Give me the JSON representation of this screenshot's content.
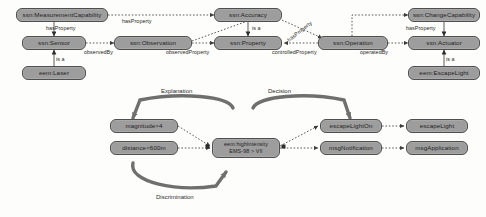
{
  "diagram": {
    "colors": {
      "node_fill": "#9d9d9d",
      "node_border": "#4f4f4f",
      "edge": "#555555",
      "arc": "#6f6f6f",
      "background": "#fdfdfb"
    },
    "upper_nodes": [
      {
        "id": "measurement_capability",
        "label": "ssn:MeasurementCapability",
        "x": 16,
        "y": 8,
        "w": 92,
        "h": 14
      },
      {
        "id": "sensor",
        "label": "ssn:Sensor",
        "x": 22,
        "y": 36,
        "w": 64,
        "h": 14
      },
      {
        "id": "laser",
        "label": "eem:Laser",
        "x": 22,
        "y": 66,
        "w": 64,
        "h": 14
      },
      {
        "id": "observation",
        "label": "ssn:Observation",
        "x": 114,
        "y": 36,
        "w": 78,
        "h": 14
      },
      {
        "id": "accuracy",
        "label": "ssn:Accuracy",
        "x": 214,
        "y": 8,
        "w": 68,
        "h": 14
      },
      {
        "id": "property",
        "label": "ssn:Property",
        "x": 214,
        "y": 36,
        "w": 68,
        "h": 14
      },
      {
        "id": "operation",
        "label": "ssn:Operation",
        "x": 318,
        "y": 36,
        "w": 70,
        "h": 14
      },
      {
        "id": "change_capability",
        "label": "ssn:ChangeCapability",
        "x": 408,
        "y": 8,
        "w": 72,
        "h": 14
      },
      {
        "id": "actuator",
        "label": "ssn:Actuator",
        "x": 408,
        "y": 36,
        "w": 72,
        "h": 14
      },
      {
        "id": "escape_light_class",
        "label": "eem:EscapeLight",
        "x": 408,
        "y": 66,
        "w": 72,
        "h": 14
      }
    ],
    "upper_edge_labels": [
      {
        "id": "has_property_sensor",
        "label": "hasProperty",
        "x": 46,
        "y": 25
      },
      {
        "id": "is_a_laser",
        "label": "is a",
        "x": 52,
        "y": 56
      },
      {
        "id": "observed_by",
        "label": "observedBy",
        "x": 88,
        "y": 50
      },
      {
        "id": "has_property_top",
        "label": "hasProperty",
        "x": 122,
        "y": 20
      },
      {
        "id": "observed_property",
        "label": "observedProperty",
        "x": 172,
        "y": 50
      },
      {
        "id": "is_a_accuracy",
        "label": "is a",
        "x": 252,
        "y": 26
      },
      {
        "id": "has_property_diagonal",
        "label": "hasProperty",
        "x": 288,
        "y": 32
      },
      {
        "id": "controlled_property",
        "label": "controlledProperty",
        "x": 272,
        "y": 50
      },
      {
        "id": "operated_by",
        "label": "operatedBy",
        "x": 362,
        "y": 50
      },
      {
        "id": "has_property_actuator",
        "label": "hasProperty",
        "x": 408,
        "y": 26
      },
      {
        "id": "is_a_escape_light",
        "label": "is a",
        "x": 440,
        "y": 56
      }
    ],
    "lower_nodes": [
      {
        "id": "magnitude_condition",
        "label": "magnitude>4",
        "x": 110,
        "y": 119,
        "w": 68,
        "h": 14,
        "two_line": false
      },
      {
        "id": "distance_condition",
        "label": "distance<600m",
        "x": 110,
        "y": 141,
        "w": 68,
        "h": 14,
        "two_line": false
      },
      {
        "id": "high_intensity",
        "label": "eem:highIntensity\nEMS-98 > VII",
        "x": 212,
        "y": 138,
        "w": 68,
        "h": 20,
        "two_line": true
      },
      {
        "id": "escape_light_on",
        "label": "escapeLightOn",
        "x": 320,
        "y": 119,
        "w": 62,
        "h": 14,
        "two_line": false
      },
      {
        "id": "msg_notification",
        "label": "msgNotification",
        "x": 320,
        "y": 141,
        "w": 62,
        "h": 14,
        "two_line": false
      },
      {
        "id": "escape_light",
        "label": "escapeLight",
        "x": 406,
        "y": 119,
        "w": 62,
        "h": 14,
        "two_line": false
      },
      {
        "id": "msg_application",
        "label": "msgApplication",
        "x": 406,
        "y": 141,
        "w": 62,
        "h": 14,
        "two_line": false
      }
    ],
    "arc_labels": [
      {
        "id": "explanation_arc",
        "label": "Explanation",
        "x": 161,
        "y": 90
      },
      {
        "id": "decision_arc",
        "label": "Decision",
        "x": 268,
        "y": 90
      },
      {
        "id": "discrimination_arc",
        "label": "Discrimination",
        "x": 156,
        "y": 196
      }
    ]
  }
}
